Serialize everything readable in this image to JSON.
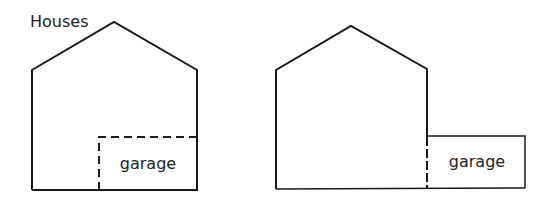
{
  "title": "Houses",
  "houses": [
    {
      "id": "left",
      "garage_label": "garage",
      "garage_position": "inside house (dashed boundary)"
    },
    {
      "id": "right",
      "garage_label": "garage",
      "garage_position": "attached outside house"
    }
  ],
  "colors": {
    "line": "#1a1a1a",
    "background": "#ffffff"
  }
}
